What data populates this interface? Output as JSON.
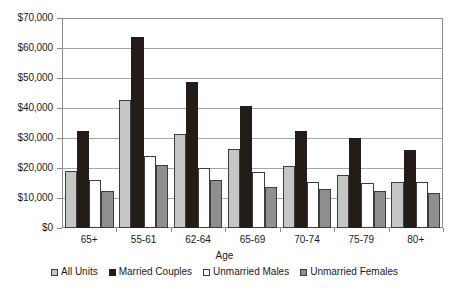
{
  "chart_data": {
    "type": "bar",
    "title": "",
    "xlabel": "Age",
    "ylabel": "",
    "ylim": [
      0,
      70000
    ],
    "ytick_step": 10000,
    "grid": true,
    "legend_position": "bottom",
    "categories": [
      "65+",
      "55-61",
      "62-64",
      "65-69",
      "70-74",
      "75-79",
      "80+"
    ],
    "ytick_labels": [
      "$0",
      "$10,000",
      "$20,000",
      "$30,000",
      "$40,000",
      "$50,000",
      "$60,000",
      "$70,000"
    ],
    "series": [
      {
        "name": "All Units",
        "color": "#c6c6c6",
        "values": [
          19000,
          42800,
          31300,
          26500,
          20800,
          17700,
          15300
        ]
      },
      {
        "name": "Married Couples",
        "color": "#241c19",
        "values": [
          32300,
          63600,
          48800,
          40800,
          32200,
          30000,
          26100
        ]
      },
      {
        "name": "Unmarried Males",
        "color": "#ffffff",
        "values": [
          16000,
          24100,
          20000,
          18800,
          15200,
          15100,
          15500
        ]
      },
      {
        "name": "Unmarried Females",
        "color": "#8f8f8f",
        "values": [
          12400,
          21100,
          16100,
          13800,
          13000,
          12500,
          11800
        ]
      }
    ]
  },
  "axis": {
    "x_title": "Age"
  },
  "colors": {
    "axis_line": "#8c8c8c",
    "gridline": "#a6a6a6",
    "bar_outline": "#3d3d3d",
    "text": "#1a1a1a"
  }
}
